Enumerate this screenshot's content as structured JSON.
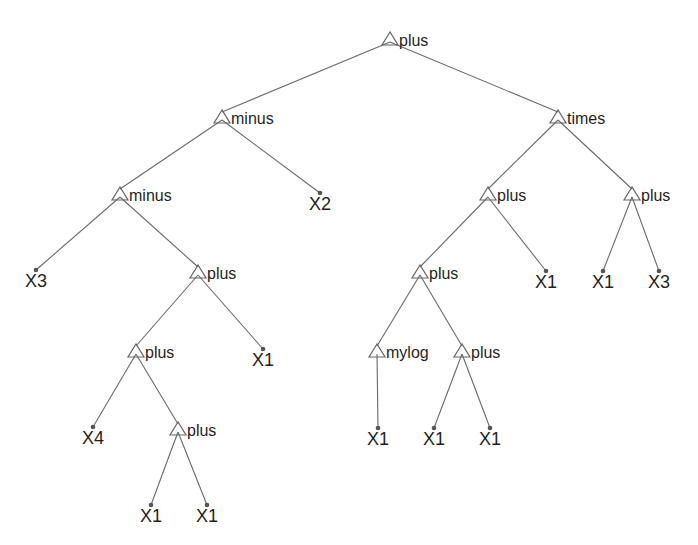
{
  "diagram": {
    "type": "expression-tree",
    "colors": {
      "edge": "#6a6a6a",
      "node_outline": "#666666",
      "text": "#1f1f1f",
      "background": "#ffffff"
    },
    "nodes": [
      {
        "id": "n0",
        "label": "plus",
        "kind": "function",
        "x": 390,
        "y": 40
      },
      {
        "id": "n1",
        "label": "minus",
        "kind": "function",
        "x": 222,
        "y": 118,
        "parent": "n0"
      },
      {
        "id": "n2",
        "label": "times",
        "kind": "function",
        "x": 558,
        "y": 118,
        "parent": "n0"
      },
      {
        "id": "n3",
        "label": "minus",
        "kind": "function",
        "x": 120,
        "y": 195,
        "parent": "n1"
      },
      {
        "id": "n4",
        "label": "X2",
        "kind": "terminal",
        "x": 320,
        "y": 196,
        "parent": "n1"
      },
      {
        "id": "n5",
        "label": "plus",
        "kind": "function",
        "x": 488,
        "y": 195,
        "parent": "n2"
      },
      {
        "id": "n6",
        "label": "plus",
        "kind": "function",
        "x": 632,
        "y": 195,
        "parent": "n2"
      },
      {
        "id": "n7",
        "label": "X3",
        "kind": "terminal",
        "x": 36,
        "y": 273,
        "parent": "n3"
      },
      {
        "id": "n8",
        "label": "plus",
        "kind": "function",
        "x": 198,
        "y": 273,
        "parent": "n3"
      },
      {
        "id": "n9",
        "label": "plus",
        "kind": "function",
        "x": 420,
        "y": 273,
        "parent": "n5"
      },
      {
        "id": "n10",
        "label": "X1",
        "kind": "terminal",
        "x": 546,
        "y": 274,
        "parent": "n5"
      },
      {
        "id": "n11",
        "label": "X1",
        "kind": "terminal",
        "x": 603,
        "y": 274,
        "parent": "n6"
      },
      {
        "id": "n12",
        "label": "X3",
        "kind": "terminal",
        "x": 659,
        "y": 274,
        "parent": "n6"
      },
      {
        "id": "n13",
        "label": "plus",
        "kind": "function",
        "x": 136,
        "y": 352,
        "parent": "n8"
      },
      {
        "id": "n14",
        "label": "X1",
        "kind": "terminal",
        "x": 263,
        "y": 352,
        "parent": "n8"
      },
      {
        "id": "n15",
        "label": "mylog",
        "kind": "function",
        "x": 377,
        "y": 352,
        "parent": "n9"
      },
      {
        "id": "n16",
        "label": "plus",
        "kind": "function",
        "x": 462,
        "y": 352,
        "parent": "n9"
      },
      {
        "id": "n17",
        "label": "X4",
        "kind": "terminal",
        "x": 93,
        "y": 430,
        "parent": "n13"
      },
      {
        "id": "n18",
        "label": "plus",
        "kind": "function",
        "x": 178,
        "y": 430,
        "parent": "n13"
      },
      {
        "id": "n19",
        "label": "X1",
        "kind": "terminal",
        "x": 378,
        "y": 431,
        "parent": "n15"
      },
      {
        "id": "n20",
        "label": "X1",
        "kind": "terminal",
        "x": 434,
        "y": 431,
        "parent": "n16"
      },
      {
        "id": "n21",
        "label": "X1",
        "kind": "terminal",
        "x": 490,
        "y": 431,
        "parent": "n16"
      },
      {
        "id": "n22",
        "label": "X1",
        "kind": "terminal",
        "x": 151,
        "y": 508,
        "parent": "n18"
      },
      {
        "id": "n23",
        "label": "X1",
        "kind": "terminal",
        "x": 207,
        "y": 508,
        "parent": "n18"
      }
    ]
  }
}
